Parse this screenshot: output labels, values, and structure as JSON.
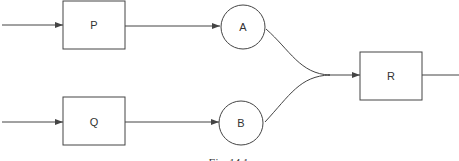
{
  "diagram": {
    "nodes": [
      {
        "id": "P",
        "shape": "box",
        "label": "P"
      },
      {
        "id": "Q",
        "shape": "box",
        "label": "Q"
      },
      {
        "id": "A",
        "shape": "circle",
        "label": "A"
      },
      {
        "id": "B",
        "shape": "circle",
        "label": "B"
      },
      {
        "id": "R",
        "shape": "box",
        "label": "R"
      }
    ],
    "edges": [
      {
        "from": "input",
        "to": "P"
      },
      {
        "from": "P",
        "to": "A"
      },
      {
        "from": "input",
        "to": "Q"
      },
      {
        "from": "Q",
        "to": "B"
      },
      {
        "from": "A",
        "to": "R"
      },
      {
        "from": "B",
        "to": "R"
      },
      {
        "from": "R",
        "to": "output"
      }
    ],
    "caption": "Fig. 14.1",
    "colors": {
      "stroke": "#444444",
      "background": "#ffffff"
    }
  }
}
